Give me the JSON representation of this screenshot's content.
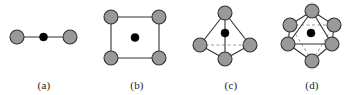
{
  "figure": {
    "background_color": "#ffffff",
    "node_fill_color": "#999999",
    "node_stroke_color": "#333333",
    "center_dot_color": "#000000",
    "edge_color": "#333333",
    "hidden_edge_color": "#999999",
    "caption_color": "#222222"
  },
  "panels": [
    {
      "id": "a",
      "caption": "(a)",
      "geometry_name": "linear",
      "ligand_count": 2,
      "center_atom_count": 1,
      "has_hidden_edges": false,
      "ligands": [
        {
          "cx": 17,
          "cy": 37,
          "r": 7
        },
        {
          "cx": 70,
          "cy": 37,
          "r": 7
        }
      ],
      "center": {
        "cx": 43.5,
        "cy": 37,
        "r": 4
      },
      "solid_edges": [
        {
          "x1": 17,
          "y1": 37,
          "x2": 70,
          "y2": 37
        }
      ],
      "dashed_edges": []
    },
    {
      "id": "b",
      "caption": "(b)",
      "geometry_name": "square planar",
      "ligand_count": 4,
      "center_atom_count": 1,
      "has_hidden_edges": false,
      "ligands": [
        {
          "cx": 23,
          "cy": 17,
          "r": 7
        },
        {
          "cx": 71,
          "cy": 17,
          "r": 7
        },
        {
          "cx": 23,
          "cy": 58,
          "r": 7
        },
        {
          "cx": 71,
          "cy": 58,
          "r": 7
        }
      ],
      "center": {
        "cx": 47,
        "cy": 37.5,
        "r": 4
      },
      "solid_edges": [
        {
          "x1": 23,
          "y1": 17,
          "x2": 71,
          "y2": 17
        },
        {
          "x1": 71,
          "y1": 17,
          "x2": 71,
          "y2": 58
        },
        {
          "x1": 71,
          "y1": 58,
          "x2": 23,
          "y2": 58
        },
        {
          "x1": 23,
          "y1": 58,
          "x2": 23,
          "y2": 17
        }
      ],
      "dashed_edges": []
    },
    {
      "id": "c",
      "caption": "(c)",
      "geometry_name": "tetrahedral",
      "ligand_count": 4,
      "center_atom_count": 1,
      "has_hidden_edges": true,
      "ligands": [
        {
          "cx": 39,
          "cy": 13,
          "r": 7
        },
        {
          "cx": 14,
          "cy": 45,
          "r": 7
        },
        {
          "cx": 64,
          "cy": 45,
          "r": 7
        },
        {
          "cx": 39,
          "cy": 59,
          "r": 7
        }
      ],
      "center": {
        "cx": 39,
        "cy": 33,
        "r": 4
      },
      "solid_edges": [
        {
          "x1": 39,
          "y1": 13,
          "x2": 14,
          "y2": 45
        },
        {
          "x1": 39,
          "y1": 13,
          "x2": 64,
          "y2": 45
        },
        {
          "x1": 39,
          "y1": 13,
          "x2": 39,
          "y2": 59
        },
        {
          "x1": 14,
          "y1": 45,
          "x2": 39,
          "y2": 59
        },
        {
          "x1": 64,
          "y1": 45,
          "x2": 39,
          "y2": 59
        }
      ],
      "dashed_edges": [
        {
          "x1": 14,
          "y1": 45,
          "x2": 64,
          "y2": 45
        }
      ]
    },
    {
      "id": "d",
      "caption": "(d)",
      "geometry_name": "octahedral",
      "ligand_count": 6,
      "center_atom_count": 1,
      "has_hidden_edges": true,
      "ligands": [
        {
          "cx": 36,
          "cy": 11,
          "r": 7
        },
        {
          "cx": 14,
          "cy": 25,
          "r": 7
        },
        {
          "cx": 58,
          "cy": 25,
          "r": 7
        },
        {
          "cx": 12,
          "cy": 44,
          "r": 7
        },
        {
          "cx": 56,
          "cy": 44,
          "r": 7
        },
        {
          "cx": 36,
          "cy": 61,
          "r": 7
        }
      ],
      "center": {
        "cx": 35,
        "cy": 33,
        "r": 4
      },
      "solid_edges": [
        {
          "x1": 36,
          "y1": 11,
          "x2": 14,
          "y2": 25
        },
        {
          "x1": 36,
          "y1": 11,
          "x2": 58,
          "y2": 25
        },
        {
          "x1": 36,
          "y1": 11,
          "x2": 12,
          "y2": 44
        },
        {
          "x1": 36,
          "y1": 11,
          "x2": 56,
          "y2": 44
        },
        {
          "x1": 14,
          "y1": 25,
          "x2": 12,
          "y2": 44
        },
        {
          "x1": 58,
          "y1": 25,
          "x2": 56,
          "y2": 44
        },
        {
          "x1": 12,
          "y1": 44,
          "x2": 56,
          "y2": 44
        },
        {
          "x1": 12,
          "y1": 44,
          "x2": 36,
          "y2": 61
        },
        {
          "x1": 56,
          "y1": 44,
          "x2": 36,
          "y2": 61
        }
      ],
      "dashed_edges": [
        {
          "x1": 14,
          "y1": 25,
          "x2": 58,
          "y2": 25
        },
        {
          "x1": 14,
          "y1": 25,
          "x2": 36,
          "y2": 61
        },
        {
          "x1": 58,
          "y1": 25,
          "x2": 36,
          "y2": 61
        }
      ]
    }
  ]
}
